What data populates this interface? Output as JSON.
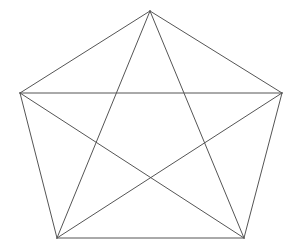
{
  "figure": {
    "name": "pentagon-pentagram",
    "canvas": {
      "width": 298,
      "height": 252
    },
    "background_color": "#ffffff",
    "line_color": "#555555",
    "line_width": 1
  },
  "chart_data": {
    "type": "diagram",
    "title": "",
    "subtitle": "",
    "xlabel": "",
    "ylabel": "",
    "grid": false,
    "legend": "none",
    "shape": "regular-pentagon-with-diagonals",
    "vertex_count": 5,
    "edge_count": 10,
    "vertices": [
      {
        "id": "apex",
        "label": "A",
        "x": 150,
        "y": 11
      },
      {
        "id": "right",
        "label": "B",
        "x": 282,
        "y": 93
      },
      {
        "id": "bottom-right",
        "label": "C",
        "x": 244,
        "y": 238
      },
      {
        "id": "bottom-left",
        "label": "D",
        "x": 57,
        "y": 238
      },
      {
        "id": "left",
        "label": "E",
        "x": 20,
        "y": 93
      }
    ],
    "edges": [
      {
        "id": "edge-apex-right",
        "kind": "side",
        "from": "apex",
        "to": "right",
        "x1": 150,
        "y1": 11,
        "x2": 282,
        "y2": 93
      },
      {
        "id": "edge-right-bottomright",
        "kind": "side",
        "from": "right",
        "to": "bottom-right",
        "x1": 282,
        "y1": 93,
        "x2": 244,
        "y2": 238
      },
      {
        "id": "edge-bottomright-bottomleft",
        "kind": "side",
        "from": "bottom-right",
        "to": "bottom-left",
        "x1": 244,
        "y1": 238,
        "x2": 57,
        "y2": 238
      },
      {
        "id": "edge-bottomleft-left",
        "kind": "side",
        "from": "bottom-left",
        "to": "left",
        "x1": 57,
        "y1": 238,
        "x2": 20,
        "y2": 93
      },
      {
        "id": "edge-left-apex",
        "kind": "side",
        "from": "left",
        "to": "apex",
        "x1": 20,
        "y1": 93,
        "x2": 150,
        "y2": 11
      },
      {
        "id": "edge-apex-bottomright",
        "kind": "diagonal",
        "from": "apex",
        "to": "bottom-right",
        "x1": 150,
        "y1": 11,
        "x2": 244,
        "y2": 238
      },
      {
        "id": "edge-apex-bottomleft",
        "kind": "diagonal",
        "from": "apex",
        "to": "bottom-left",
        "x1": 150,
        "y1": 11,
        "x2": 57,
        "y2": 238
      },
      {
        "id": "edge-right-bottomleft",
        "kind": "diagonal",
        "from": "right",
        "to": "bottom-left",
        "x1": 282,
        "y1": 93,
        "x2": 57,
        "y2": 238
      },
      {
        "id": "edge-left-bottomright",
        "kind": "diagonal",
        "from": "left",
        "to": "bottom-right",
        "x1": 20,
        "y1": 93,
        "x2": 244,
        "y2": 238
      },
      {
        "id": "edge-left-right",
        "kind": "diagonal",
        "from": "left",
        "to": "right",
        "x1": 20,
        "y1": 93,
        "x2": 282,
        "y2": 93
      }
    ]
  }
}
